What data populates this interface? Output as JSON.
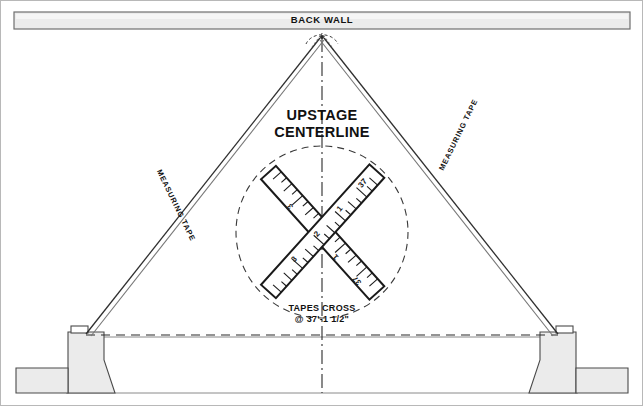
{
  "labels": {
    "back_wall": "BACK WALL",
    "upstage_line1": "UPSTAGE",
    "upstage_line2": "CENTERLINE",
    "tapes_cross_line1": "TAPES CROSS",
    "tapes_cross_line2": "@ 37'-1 1/2\"",
    "measuring_tape_left": "MEASURING TAPE",
    "measuring_tape_right": "MEASURING TAPE"
  },
  "measurement": {
    "crossing_distance": "37'-1 1/2\"",
    "feet": 37,
    "inches": "1 1/2"
  },
  "tape_numerals": {
    "left_tape": [
      "3",
      "2",
      "1",
      "37"
    ],
    "right_tape": [
      "3",
      "2",
      "1",
      "37"
    ]
  },
  "colors": {
    "line": "#1a1a1a",
    "wall_fill": "#e8e8e8",
    "platform_fill": "#ececec",
    "frame_border": "#b8b8b8",
    "dashed": "#333333"
  },
  "geometry": {
    "apex_x": 322,
    "apex_y": 37,
    "cross_x": 322,
    "cross_y": 230,
    "circle_radius": 86
  }
}
